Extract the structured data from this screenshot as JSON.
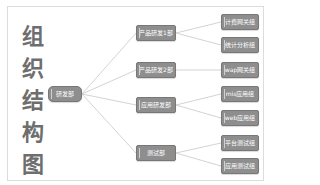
{
  "title": {
    "chars": [
      "组",
      "织",
      "结",
      "构",
      "图"
    ]
  },
  "colors": {
    "node_fill": "#8e8e8e",
    "node_border": "#777777",
    "line": "#c8c8c8",
    "title": "#6e6e6e"
  },
  "root": {
    "label": "研发部"
  },
  "departments": [
    {
      "label": "产品研发1部",
      "teams": [
        "计费网关组",
        "统计分析组"
      ]
    },
    {
      "label": "产品研发2部",
      "teams": [
        "wap网关组"
      ]
    },
    {
      "label": "应用研发部",
      "teams": [
        "mis应用组",
        "web应用组"
      ]
    },
    {
      "label": "测试部",
      "teams": [
        "平台测试组",
        "应用测试组"
      ]
    }
  ]
}
